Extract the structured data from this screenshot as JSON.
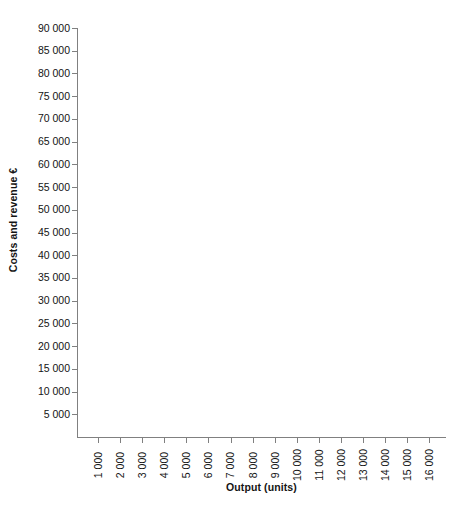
{
  "chart_data": {
    "type": "line",
    "title": "",
    "subtitle": "",
    "xlabel": "Output (units)",
    "ylabel": "Costs and revenue €",
    "x_tick_labels": [
      "1 000",
      "2 000",
      "3 000",
      "4 000",
      "5 000",
      "6 000",
      "7 000",
      "8 000",
      "9 000",
      "10 000",
      "11 000",
      "12 000",
      "13 000",
      "14 000",
      "15 000",
      "16 000"
    ],
    "x_tick_values": [
      1000,
      2000,
      3000,
      4000,
      5000,
      6000,
      7000,
      8000,
      9000,
      10000,
      11000,
      12000,
      13000,
      14000,
      15000,
      16000
    ],
    "y_tick_labels": [
      "5 000",
      "10 000",
      "15 000",
      "20 000",
      "25 000",
      "30 000",
      "35 000",
      "40 000",
      "45 000",
      "50 000",
      "55 000",
      "60 000",
      "65 000",
      "70 000",
      "75 000",
      "80 000",
      "85 000",
      "90 000"
    ],
    "y_tick_values": [
      5000,
      10000,
      15000,
      20000,
      25000,
      30000,
      35000,
      40000,
      45000,
      50000,
      55000,
      60000,
      65000,
      70000,
      75000,
      80000,
      85000,
      90000
    ],
    "xlim": [
      0,
      16500
    ],
    "ylim": [
      0,
      90000
    ],
    "x_tick_step": 1000,
    "y_tick_step": 5000,
    "grid": false,
    "legend": false,
    "legend_position": "none",
    "series": [],
    "annotations": [],
    "axis_color": "#808080",
    "text_color": "#141414",
    "background_color": "#ffffff",
    "note": "empty plot area — blank graph template with no plotted data"
  }
}
